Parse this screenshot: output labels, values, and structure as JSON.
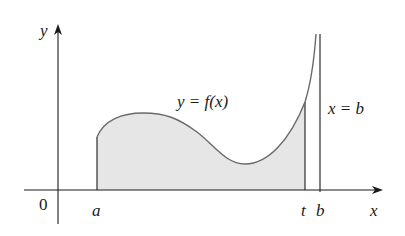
{
  "figure": {
    "type": "improper-integral-area-diagram",
    "labels": {
      "y_axis": "y",
      "x_axis": "x",
      "origin": "0",
      "a": "a",
      "t": "t",
      "b": "b",
      "curve": "y = f(x)",
      "asymptote": "x = b"
    },
    "colors": {
      "axis": "#1a1a1a",
      "curve": "#6a6a6a",
      "fill": "#e6e6e6",
      "background": "#ffffff"
    }
  }
}
